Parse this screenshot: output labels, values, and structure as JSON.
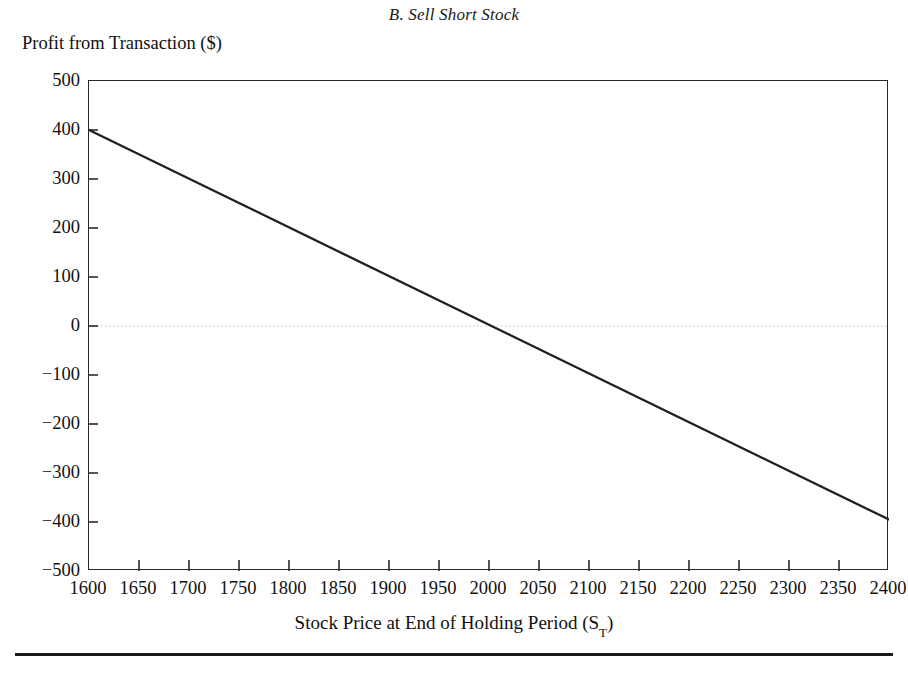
{
  "panel": {
    "title": "B. Sell Short Stock"
  },
  "axes": {
    "y_title": "Profit from Transaction ($)",
    "x_title_main": "Stock Price at End of Holding Period (S",
    "x_title_sub": "T",
    "x_title_close": ")",
    "y_ticks": [
      "500",
      "400",
      "300",
      "200",
      "100",
      "0",
      "-100",
      "-200",
      "-300",
      "-400",
      "-500"
    ],
    "x_ticks": [
      "1600",
      "1650",
      "1700",
      "1750",
      "1800",
      "1850",
      "1900",
      "1950",
      "2000",
      "2050",
      "2100",
      "2150",
      "2200",
      "2250",
      "2300",
      "2350",
      "2400"
    ]
  },
  "colors": {
    "line": "#1f1f1f",
    "frame": "#2a2a2a",
    "zero_line": "#d8d8d8",
    "text": "#111111",
    "background": "#ffffff"
  },
  "chart_data": {
    "type": "line",
    "title": "B. Sell Short Stock",
    "xlabel": "Stock Price at End of Holding Period (S_T)",
    "ylabel": "Profit from Transaction ($)",
    "xlim": [
      1600,
      2400
    ],
    "ylim": [
      -500,
      500
    ],
    "xticks": [
      1600,
      1650,
      1700,
      1750,
      1800,
      1850,
      1900,
      1950,
      2000,
      2050,
      2100,
      2150,
      2200,
      2250,
      2300,
      2350,
      2400
    ],
    "yticks": [
      -500,
      -400,
      -300,
      -200,
      -100,
      0,
      100,
      200,
      300,
      400,
      500
    ],
    "grid": false,
    "legend": null,
    "zero_reference_line": 0,
    "series": [
      {
        "name": "Sell short stock profit",
        "x": [
          1600,
          1650,
          1700,
          1750,
          1800,
          1850,
          1900,
          1950,
          2000,
          2010,
          2050,
          2100,
          2150,
          2200,
          2250,
          2300,
          2350,
          2400
        ],
        "values": [
          400,
          375,
          350,
          325,
          300,
          275,
          250,
          225,
          200,
          195,
          175,
          150,
          100,
          50,
          0,
          -150,
          -275,
          -395
        ]
      }
    ],
    "line_description": "Straight downward-sloping line from (1600, 400) to (2400, -395), crossing zero profit at approximately S_T = 2005"
  }
}
